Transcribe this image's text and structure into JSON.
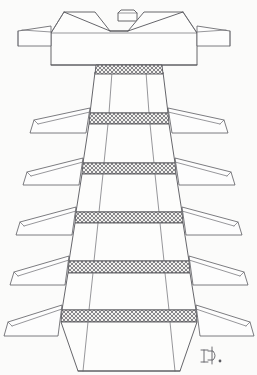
{
  "figure": {
    "title": "Stacked Tiered Column Line Drawing",
    "medium": "ink line drawing",
    "background_color": "#fbfbfa",
    "ink_color": "#55555a",
    "hatch_color": "#6b6b70",
    "width": 257,
    "height": 375,
    "orientation": "vertical",
    "tier_count": 6,
    "band_count": 6,
    "fin_pair_count": 6,
    "signature": {
      "label": "artist-monogram",
      "text": "Ð.",
      "x": 205,
      "y": 355
    },
    "parts": [
      {
        "name": "top-cap-block",
        "label": "Top cap with V-groove"
      },
      {
        "name": "top-knob",
        "label": "Knob"
      },
      {
        "name": "cap-side-tab-left",
        "label": "Left cap tab"
      },
      {
        "name": "cap-side-tab-right",
        "label": "Right cap tab"
      },
      {
        "name": "tier-stack",
        "label": "Tapered tier stack"
      },
      {
        "name": "hatched-band",
        "label": "Cross-hatched joint band"
      },
      {
        "name": "fin-left",
        "label": "Left wing fin"
      },
      {
        "name": "fin-right",
        "label": "Right wing fin"
      },
      {
        "name": "base-flare",
        "label": "Flared base"
      }
    ],
    "tiers": [
      {
        "index": 1,
        "band_y": 72,
        "fin_y": 82,
        "half_width_top": 33,
        "half_width_bottom": 40
      },
      {
        "index": 2,
        "band_y": 122,
        "fin_y": 132,
        "half_width_top": 40,
        "half_width_bottom": 47
      },
      {
        "index": 3,
        "band_y": 172,
        "fin_y": 182,
        "half_width_top": 47,
        "half_width_bottom": 54
      },
      {
        "index": 4,
        "band_y": 221,
        "fin_y": 231,
        "half_width_top": 54,
        "half_width_bottom": 61
      },
      {
        "index": 5,
        "band_y": 270,
        "fin_y": 280,
        "half_width_top": 61,
        "half_width_bottom": 68
      },
      {
        "index": 6,
        "band_y": 318,
        "fin_y": 328,
        "half_width_top": 68,
        "half_width_bottom": 77
      }
    ]
  }
}
